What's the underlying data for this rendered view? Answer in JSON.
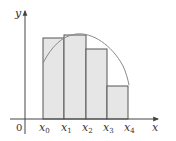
{
  "diagram": {
    "type": "riemann-sum-left-endpoints",
    "axes": {
      "x_label": "x",
      "y_label": "y",
      "origin_label": "0"
    },
    "partition_labels": [
      {
        "base": "x",
        "sub": "0"
      },
      {
        "base": "x",
        "sub": "1"
      },
      {
        "base": "x",
        "sub": "2"
      },
      {
        "base": "x",
        "sub": "3"
      },
      {
        "base": "x",
        "sub": "4"
      }
    ],
    "colors": {
      "rect_fill": "#e6e6e6",
      "rect_stroke": "#555555",
      "curve": "#8a8a8a",
      "axis": "#444444",
      "text": "#333333"
    }
  }
}
